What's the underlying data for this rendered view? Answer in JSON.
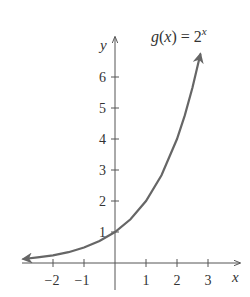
{
  "chart_data": {
    "type": "line",
    "title_parts": {
      "lhs_fn": "g",
      "lhs_open": "(",
      "lhs_var": "x",
      "lhs_close": ")",
      "eq": " = 2",
      "exponent": "x"
    },
    "xlabel": "x",
    "ylabel": "y",
    "xlim": [
      -2.95,
      3.4
    ],
    "ylim": [
      0,
      7.2
    ],
    "x_ticks": [
      -2,
      -1,
      1,
      2,
      3
    ],
    "x_tick_labels": [
      "−2",
      "−1",
      "1",
      "2",
      "3"
    ],
    "y_ticks": [
      1,
      2,
      3,
      4,
      5,
      6
    ],
    "y_tick_labels": [
      "1",
      "2",
      "3",
      "4",
      "5",
      "6"
    ],
    "grid": false,
    "legend": "none",
    "series": [
      {
        "name": "g(x) = 2^x",
        "x": [
          -2.95,
          -2.5,
          -2,
          -1.5,
          -1,
          -0.5,
          0,
          0.5,
          1,
          1.5,
          2,
          2.25,
          2.5,
          2.75
        ],
        "values": [
          0.13,
          0.18,
          0.25,
          0.35,
          0.5,
          0.71,
          1,
          1.41,
          2,
          2.83,
          4,
          4.76,
          5.66,
          6.73
        ],
        "color": "#666666",
        "arrows": "both"
      }
    ]
  }
}
